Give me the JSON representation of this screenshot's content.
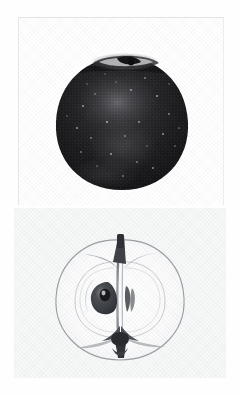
{
  "page": {
    "background_color": "#ffffff",
    "width": 242,
    "height": 395,
    "media_type": "scanned halftone photograph",
    "visible_text": ""
  },
  "plates": [
    {
      "id": "whole-apple",
      "label": "Whole apple, exterior view",
      "position": "top",
      "frame": {
        "x": 18,
        "y": 17,
        "width": 206,
        "height": 188
      },
      "background_color": "#ffffff",
      "border_color": "#e6e6e6",
      "subject": {
        "name": "apple",
        "view": "whole fruit, side elevation",
        "tone": "very dark, near black",
        "fill_color": "#1d1d1f",
        "highlight_color": "#6e6e72",
        "bounds": {
          "cx": 121,
          "cy": 124,
          "rx": 64,
          "ry": 67
        },
        "features": [
          {
            "name": "stem-cavity",
            "description": "bright rimmed depression at apex with dark stem"
          },
          {
            "name": "stem",
            "description": "short dark stem in cavity",
            "color": "#101012"
          },
          {
            "name": "highlight-bloom",
            "description": "soft diffuse sheen on upper middle of fruit"
          },
          {
            "name": "lenticel-speckles",
            "description": "scattered pale dots across skin",
            "color": "#b9b9bd"
          },
          {
            "name": "shoulder-shadow",
            "description": "darker band below the stem shoulder"
          }
        ]
      }
    },
    {
      "id": "apple-cross-section",
      "label": "Apple cut lengthwise, interior view",
      "position": "bottom",
      "frame": {
        "x": 14,
        "y": 208,
        "width": 212,
        "height": 170
      },
      "background_color": "#f7f8f8",
      "subject": {
        "name": "apple half",
        "view": "longitudinal section through core",
        "tone": "pale, translucent line drawing appearance",
        "outline_color": "#9a9ea3",
        "flesh_color": "#fbfbfb",
        "bounds": {
          "cx": 120,
          "cy": 300,
          "rx": 58,
          "ry": 58
        },
        "features": [
          {
            "name": "skin-outline",
            "description": "thin grey contour of the fruit half"
          },
          {
            "name": "core-line",
            "description": "faint inner ring marking the core boundary"
          },
          {
            "name": "core-axis",
            "description": "vertical fibrous column from stem to calyx",
            "color": "#6b6e72"
          },
          {
            "name": "seed",
            "description": "dark teardrop seed left of the core with pale inner gleam",
            "color": "#3a3c3f"
          },
          {
            "name": "seed-chamber",
            "description": "narrow dark slits right of the core"
          },
          {
            "name": "stem-top",
            "description": "dark stem rising from funnel-shaped stem cavity",
            "color": "#4a4c50"
          },
          {
            "name": "calyx",
            "description": "dark starburst at the blossom end",
            "color": "#3f4145"
          }
        ]
      }
    }
  ],
  "colors": {
    "paper": "#ffffff",
    "plate_tint": "#f7f8f8",
    "apple_dark": "#1d1d1f",
    "outline_grey": "#9a9ea3",
    "border_grey": "#e6e6e6"
  }
}
